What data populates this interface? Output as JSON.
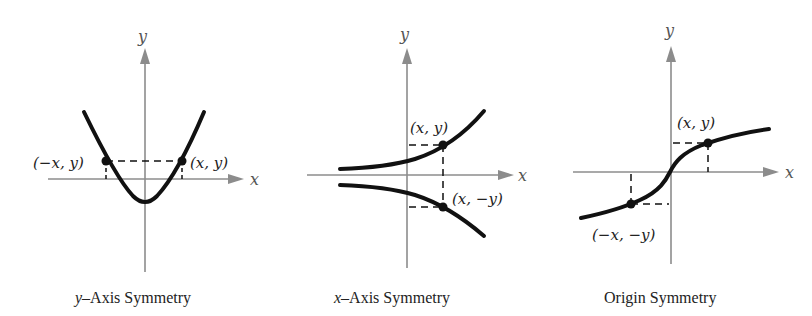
{
  "panels": [
    {
      "id": "y-axis-symmetry",
      "caption": "y–Axis Symmetry",
      "caption_italic_prefix": "y",
      "caption_rest": "–Axis Symmetry",
      "axis_labels": {
        "x": "x",
        "y": "y"
      },
      "points": [
        {
          "label": "(−x, y)"
        },
        {
          "label": "(x, y)"
        }
      ]
    },
    {
      "id": "x-axis-symmetry",
      "caption": "x–Axis Symmetry",
      "caption_italic_prefix": "x",
      "caption_rest": "–Axis Symmetry",
      "axis_labels": {
        "x": "x",
        "y": "y"
      },
      "points": [
        {
          "label": "(x, y)"
        },
        {
          "label": "(x, −y)"
        }
      ]
    },
    {
      "id": "origin-symmetry",
      "caption": "Origin Symmetry",
      "axis_labels": {
        "x": "x",
        "y": "y"
      },
      "points": [
        {
          "label": "(x, y)"
        },
        {
          "label": "(−x, −y)"
        }
      ]
    }
  ],
  "colors": {
    "axis": "#8c8c8c",
    "curve": "#111111",
    "text": "#222222"
  }
}
